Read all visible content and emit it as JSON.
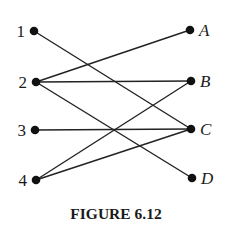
{
  "figure": {
    "caption": "FIGURE 6.12",
    "type": "bipartite-graph",
    "left_nodes": [
      {
        "id": "1",
        "label": "1",
        "x": 34,
        "y": 31
      },
      {
        "id": "2",
        "label": "2",
        "x": 36,
        "y": 82
      },
      {
        "id": "3",
        "label": "3",
        "x": 35,
        "y": 130
      },
      {
        "id": "4",
        "label": "4",
        "x": 36,
        "y": 180
      }
    ],
    "right_nodes": [
      {
        "id": "A",
        "label": "A",
        "x": 190,
        "y": 30
      },
      {
        "id": "B",
        "label": "B",
        "x": 191,
        "y": 81
      },
      {
        "id": "C",
        "label": "C",
        "x": 191,
        "y": 129
      },
      {
        "id": "D",
        "label": "D",
        "x": 192,
        "y": 178
      }
    ],
    "edges": [
      [
        "1",
        "C"
      ],
      [
        "2",
        "A"
      ],
      [
        "2",
        "B"
      ],
      [
        "2",
        "D"
      ],
      [
        "3",
        "C"
      ],
      [
        "4",
        "B"
      ],
      [
        "4",
        "C"
      ]
    ]
  }
}
